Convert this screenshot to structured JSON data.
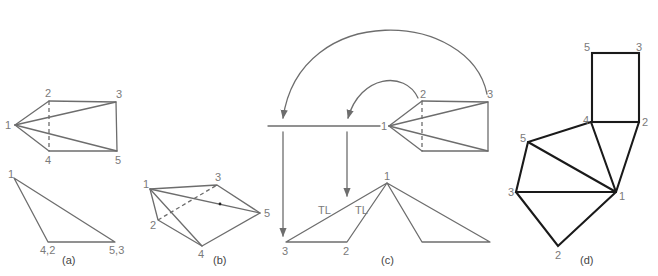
{
  "figure": {
    "panels": [
      {
        "id": "a",
        "caption": "(a)",
        "top_view_labels": [
          "1",
          "2",
          "3",
          "4",
          "5"
        ],
        "front_view_labels": [
          "1",
          "4,2",
          "5,3"
        ]
      },
      {
        "id": "b",
        "caption": "(b)",
        "labels": [
          "1",
          "2",
          "3",
          "4",
          "5"
        ]
      },
      {
        "id": "c",
        "caption": "(c)",
        "top_view_labels": [
          "1",
          "2",
          "3"
        ],
        "front_view_labels": [
          "1",
          "3",
          "2"
        ],
        "true_length_labels": [
          "TL",
          "TL"
        ]
      },
      {
        "id": "d",
        "caption": "(d)",
        "labels": [
          "5",
          "3",
          "4",
          "2",
          "5",
          "3",
          "1",
          "2"
        ]
      }
    ]
  },
  "colors": {
    "line": "#6d6d6d",
    "pattern_line": "#1a1a1a",
    "label": "#7a7a7a"
  }
}
